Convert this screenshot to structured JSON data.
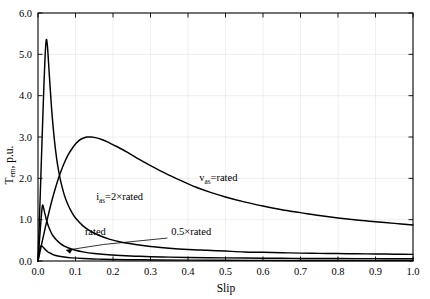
{
  "chart_data": {
    "type": "line",
    "title": "",
    "xlabel": "Slip",
    "ylabel": "Tₑₘ, p.u.",
    "ylabel_base": "T",
    "ylabel_sub": "em",
    "ylabel_tail": ", p.u.",
    "xlim": [
      0.0,
      1.0
    ],
    "ylim": [
      0.0,
      6.0
    ],
    "grid": true,
    "legend_position": "inline-annotations",
    "xticks": [
      "0.0",
      "0.1",
      "0.2",
      "0.3",
      "0.4",
      "0.5",
      "0.6",
      "0.7",
      "0.8",
      "0.9",
      "1.0"
    ],
    "xtick_values": [
      0.0,
      0.1,
      0.2,
      0.3,
      0.4,
      0.5,
      0.6,
      0.7,
      0.8,
      0.9,
      1.0
    ],
    "yticks": [
      "0.0",
      "1.0",
      "2.0",
      "3.0",
      "4.0",
      "5.0",
      "6.0"
    ],
    "ytick_values": [
      0.0,
      1.0,
      2.0,
      3.0,
      4.0,
      5.0,
      6.0
    ],
    "annotations": [
      {
        "name": "v-as-rated",
        "text": "v",
        "sub": "as",
        "tail": "=rated",
        "x": 0.43,
        "y": 1.93
      },
      {
        "name": "i-as-2x-rated",
        "text": "i",
        "sub": "as",
        "tail": "=2×rated",
        "x": 0.155,
        "y": 1.47
      },
      {
        "name": "rated",
        "text": "rated",
        "sub": "",
        "tail": "",
        "x": 0.125,
        "y": 0.62
      },
      {
        "name": "half-rated",
        "text": "0.5×rated",
        "sub": "",
        "tail": "",
        "x": 0.355,
        "y": 0.62
      }
    ],
    "series": [
      {
        "name": "v_as = rated",
        "comment": "Voltage-fed torque-slip curve, breakdown torque 3.0 p.u. near slip 0.13",
        "x": [
          0.0,
          0.005,
          0.01,
          0.02,
          0.03,
          0.04,
          0.05,
          0.06,
          0.07,
          0.08,
          0.09,
          0.1,
          0.11,
          0.12,
          0.13,
          0.14,
          0.15,
          0.17,
          0.19,
          0.21,
          0.24,
          0.27,
          0.3,
          0.34,
          0.38,
          0.42,
          0.46,
          0.5,
          0.55,
          0.6,
          0.65,
          0.7,
          0.75,
          0.8,
          0.85,
          0.9,
          0.95,
          1.0
        ],
        "y": [
          0.0,
          0.21,
          0.42,
          0.83,
          1.21,
          1.56,
          1.87,
          2.14,
          2.37,
          2.56,
          2.71,
          2.83,
          2.92,
          2.97,
          3.0,
          3.0,
          2.99,
          2.94,
          2.86,
          2.77,
          2.62,
          2.46,
          2.31,
          2.12,
          1.95,
          1.79,
          1.66,
          1.55,
          1.43,
          1.33,
          1.24,
          1.17,
          1.1,
          1.04,
          0.99,
          0.95,
          0.91,
          0.87
        ]
      },
      {
        "name": "i_as = 2 x rated",
        "comment": "Current-fed (2x rated current) sharp spike peaking 5.35 p.u. at slip ~0.022",
        "x": [
          0.0,
          0.004,
          0.008,
          0.012,
          0.016,
          0.019,
          0.022,
          0.025,
          0.028,
          0.032,
          0.036,
          0.04,
          0.045,
          0.05,
          0.055,
          0.06,
          0.07,
          0.08,
          0.09,
          0.1,
          0.12,
          0.14,
          0.16,
          0.19,
          0.22,
          0.26,
          0.3,
          0.35,
          0.4,
          0.45,
          0.5,
          0.55,
          0.6,
          0.65,
          0.7,
          0.75,
          0.8,
          0.85,
          0.9,
          0.95,
          1.0
        ],
        "y": [
          0.0,
          1.05,
          2.15,
          3.25,
          4.3,
          4.97,
          5.35,
          5.22,
          4.82,
          4.25,
          3.72,
          3.28,
          2.82,
          2.46,
          2.18,
          1.95,
          1.6,
          1.36,
          1.18,
          1.04,
          0.85,
          0.72,
          0.63,
          0.53,
          0.46,
          0.4,
          0.35,
          0.31,
          0.28,
          0.26,
          0.24,
          0.22,
          0.21,
          0.2,
          0.19,
          0.185,
          0.18,
          0.175,
          0.17,
          0.165,
          0.16
        ]
      },
      {
        "name": "rated",
        "comment": "Current-fed at rated current, peak ~1.35 p.u. at slip ~0.012",
        "x": [
          0.0,
          0.003,
          0.006,
          0.009,
          0.012,
          0.015,
          0.018,
          0.022,
          0.026,
          0.03,
          0.035,
          0.04,
          0.05,
          0.06,
          0.07,
          0.08,
          0.1,
          0.12,
          0.15,
          0.18,
          0.22,
          0.26,
          0.3,
          0.35,
          0.4,
          0.45,
          0.5,
          0.55,
          0.6,
          0.65,
          0.7,
          0.75,
          0.8,
          0.85,
          0.9,
          0.95,
          1.0
        ],
        "y": [
          0.0,
          0.38,
          0.76,
          1.1,
          1.35,
          1.28,
          1.16,
          1.01,
          0.89,
          0.79,
          0.69,
          0.61,
          0.5,
          0.42,
          0.36,
          0.32,
          0.26,
          0.22,
          0.18,
          0.155,
          0.133,
          0.117,
          0.105,
          0.094,
          0.086,
          0.08,
          0.075,
          0.071,
          0.068,
          0.065,
          0.063,
          0.061,
          0.059,
          0.058,
          0.057,
          0.056,
          0.055
        ]
      },
      {
        "name": "0.5 x rated",
        "comment": "Current-fed at half rated current, peak ~0.37 p.u. very near zero slip",
        "x": [
          0.0,
          0.003,
          0.006,
          0.009,
          0.012,
          0.016,
          0.02,
          0.025,
          0.03,
          0.04,
          0.05,
          0.07,
          0.09,
          0.12,
          0.16,
          0.2,
          0.26,
          0.32,
          0.4,
          0.5,
          0.6,
          0.7,
          0.8,
          0.9,
          1.0
        ],
        "y": [
          0.0,
          0.2,
          0.33,
          0.37,
          0.35,
          0.31,
          0.27,
          0.23,
          0.2,
          0.155,
          0.128,
          0.095,
          0.076,
          0.059,
          0.046,
          0.038,
          0.03,
          0.025,
          0.021,
          0.017,
          0.015,
          0.013,
          0.012,
          0.012,
          0.011
        ]
      }
    ]
  }
}
